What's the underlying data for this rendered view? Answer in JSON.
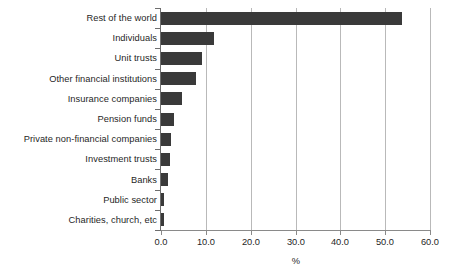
{
  "chart_data": {
    "type": "bar",
    "orientation": "horizontal",
    "title": "",
    "subtitle": "",
    "xlabel": "%",
    "ylabel": "",
    "xlim": [
      0.0,
      60.0
    ],
    "xticks": [
      "0.0",
      "10.0",
      "20.0",
      "30.0",
      "40.0",
      "50.0",
      "60.0"
    ],
    "xtick_values": [
      0,
      10,
      20,
      30,
      40,
      50,
      60
    ],
    "grid": "vertical",
    "legend": "none",
    "bar_color": "#3a3a3a",
    "gridline_color": "#b9b9b9",
    "axis_color": "#8a8a8a",
    "categories": [
      "Rest of the world",
      "Individuals",
      "Unit trusts",
      "Other financial institutions",
      "Insurance companies",
      "Pension funds",
      "Private non-financial companies",
      "Investment trusts",
      "Banks",
      "Public sector",
      "Charities, church, etc"
    ],
    "values": [
      53.8,
      11.8,
      9.2,
      7.8,
      4.7,
      2.9,
      2.2,
      2.0,
      1.6,
      0.7,
      0.6
    ]
  }
}
